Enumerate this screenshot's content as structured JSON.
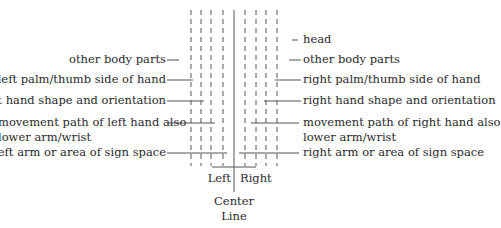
{
  "diagram": {
    "head_label": "head",
    "left_labels": [
      {
        "id": "other-body-parts-left",
        "text": "other body parts"
      },
      {
        "id": "left-palm",
        "text": "left palm/thumb side of hand"
      },
      {
        "id": "left-hand-shape",
        "text": "left hand shape and orientation"
      },
      {
        "id": "left-movement",
        "text": "movement path of left hand also"
      },
      {
        "id": "left-lower-arm",
        "text": "lower arm/wrist"
      },
      {
        "id": "left-arm-area",
        "text": "left arm or area of sign space"
      }
    ],
    "right_labels": [
      {
        "id": "other-body-parts-right",
        "text": "other body parts"
      },
      {
        "id": "right-palm",
        "text": "right palm/thumb side of hand"
      },
      {
        "id": "right-hand-shape",
        "text": "right hand shape and orientation"
      },
      {
        "id": "right-movement",
        "text": "movement path of right hand also"
      },
      {
        "id": "right-lower-arm",
        "text": "lower arm/wrist"
      },
      {
        "id": "right-arm-area",
        "text": "right arm or area of sign space"
      }
    ],
    "bottom": {
      "left": "Left",
      "right": "Right",
      "center_line_1": "Center",
      "center_line_2": "Line"
    }
  }
}
